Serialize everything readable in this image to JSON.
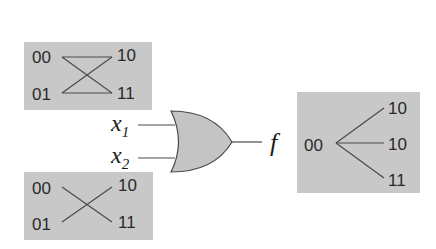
{
  "diagram": {
    "type": "or-gate-state-transition",
    "colors": {
      "box_fill": "#c8c8c8",
      "gate_fill": "#c4c4c4",
      "line": "#4a4a4a",
      "text": "#2a2a2a"
    },
    "gate": {
      "kind": "OR",
      "inputs": [
        "x1",
        "x2"
      ],
      "input_labels": [
        {
          "base": "x",
          "sub": "1"
        },
        {
          "base": "x",
          "sub": "2"
        }
      ],
      "output_label": "f"
    },
    "panels": {
      "top_left": {
        "states": {
          "top_left": "00",
          "bottom_left": "01",
          "top_right": "10",
          "bottom_right": "11"
        },
        "edges": [
          [
            "00",
            "10"
          ],
          [
            "00",
            "11"
          ],
          [
            "01",
            "10"
          ],
          [
            "01",
            "11"
          ]
        ]
      },
      "bottom_left": {
        "states": {
          "top_left": "00",
          "bottom_left": "01",
          "top_right": "10",
          "bottom_right": "11"
        },
        "edges": [
          [
            "00",
            "11"
          ],
          [
            "01",
            "10"
          ]
        ]
      },
      "right": {
        "source": "00",
        "targets": [
          "10",
          "10",
          "11"
        ],
        "edges": [
          [
            "00",
            "10"
          ],
          [
            "00",
            "10"
          ],
          [
            "00",
            "11"
          ]
        ]
      }
    }
  }
}
